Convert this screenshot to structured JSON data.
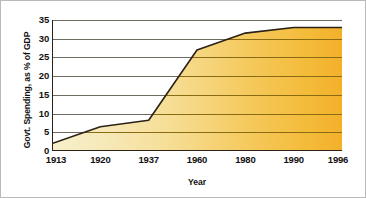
{
  "chart_data": {
    "type": "area",
    "title": "",
    "xlabel": "Year",
    "ylabel": "Govt. Spending, as % of GDP",
    "categories": [
      "1913",
      "1920",
      "1937",
      "1960",
      "1980",
      "1990",
      "1996"
    ],
    "values": [
      2,
      6.5,
      8.2,
      27,
      31.5,
      33,
      33
    ],
    "ylim": [
      0,
      35
    ],
    "yticks": [
      "0",
      "5",
      "10",
      "15",
      "20",
      "25",
      "30",
      "35"
    ],
    "ytick_values": [
      0,
      5,
      10,
      15,
      20,
      25,
      30,
      35
    ],
    "grid": true,
    "legend": "none",
    "series": [
      {
        "name": "Govt. Spending, as % of GDP",
        "values": [
          2,
          6.5,
          8.2,
          27,
          31.5,
          33,
          33
        ]
      }
    ],
    "colors": {
      "fill_left": "#f6eec4",
      "fill_right": "#f4b52f",
      "outline": "#2b2114",
      "gridline": "#6e6b62",
      "gridline_over_fill": "#8a6a13",
      "axis": "#2b2114",
      "text": "#111111",
      "background": "#ffffff",
      "border": "#b9b9b9"
    }
  }
}
